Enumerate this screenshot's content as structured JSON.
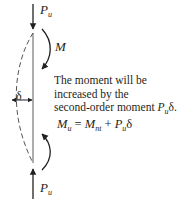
{
  "diagram": {
    "top_load": {
      "symbol": "P",
      "subscript": "u",
      "direction": "down"
    },
    "bottom_load": {
      "symbol": "P",
      "subscript": "u",
      "direction": "up"
    },
    "moment_label": "M",
    "deflection_label": "δ",
    "note_lines": [
      "The moment will be",
      "increased by the",
      "second-order moment "
    ],
    "note_term": {
      "symbol": "P",
      "subscript": "u",
      "suffix": "δ."
    },
    "formula": {
      "lhs": "M",
      "lhs_sub": "u",
      "equals": " = ",
      "term1": "M",
      "term1_sub": "nt",
      "plus": " + ",
      "term2": "P",
      "term2_sub": "u",
      "term2_suffix": "δ"
    },
    "colors": {
      "ink": "#231f20",
      "column": "#8a8a8a",
      "dashed_curve": "#555555"
    }
  }
}
